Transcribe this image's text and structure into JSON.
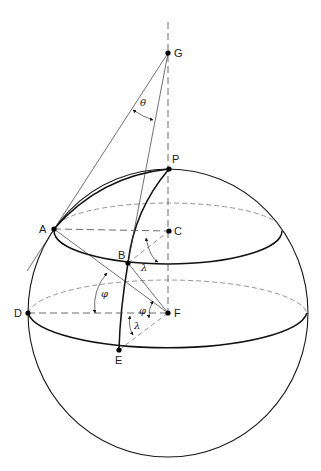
{
  "figure": {
    "points": [
      {
        "label": "G",
        "x": 168,
        "y": 53
      },
      {
        "label": "P",
        "x": 169,
        "y": 169
      },
      {
        "label": "A",
        "x": 54,
        "y": 229
      },
      {
        "label": "C",
        "x": 169,
        "y": 231
      },
      {
        "label": "B",
        "x": 128,
        "y": 263
      },
      {
        "label": "D",
        "x": 28,
        "y": 313
      },
      {
        "label": "F",
        "x": 168,
        "y": 313
      },
      {
        "label": "E",
        "x": 119,
        "y": 350
      }
    ],
    "angles": [
      {
        "symbol": "θ",
        "meaning": "cone half-angle at G"
      },
      {
        "symbol": "λ",
        "meaning": "longitude at C"
      },
      {
        "symbol": "φ",
        "meaning": "latitude between A-F and D-F"
      },
      {
        "symbol": "φ",
        "meaning": "latitude at F"
      },
      {
        "symbol": "λ",
        "meaning": "longitude at F"
      }
    ]
  },
  "labels": {
    "G": "G",
    "P": "P",
    "A": "A",
    "C": "C",
    "B": "B",
    "D": "D",
    "F": "F",
    "E": "E",
    "theta": "θ",
    "lambda_upper": "λ",
    "phi_left": "φ",
    "phi_center": "φ",
    "lambda_lower": "λ"
  }
}
